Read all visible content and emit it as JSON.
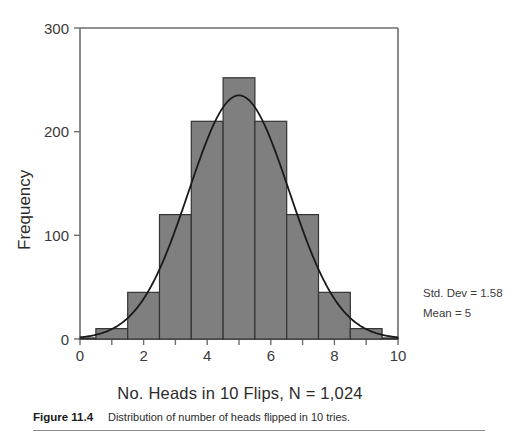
{
  "chart_data": {
    "type": "bar",
    "title": "",
    "xlabel": "No. Heads in 10 Flips, N = 1,024",
    "ylabel": "Frequency",
    "categories": [
      "0",
      "1",
      "2",
      "3",
      "4",
      "5",
      "6",
      "7",
      "8",
      "9",
      "10"
    ],
    "x": [
      0,
      1,
      2,
      3,
      4,
      5,
      6,
      7,
      8,
      9,
      10
    ],
    "values": [
      1,
      10,
      45,
      120,
      210,
      252,
      210,
      120,
      45,
      10,
      1
    ],
    "bar_width": 1,
    "xlim": [
      0,
      10
    ],
    "ylim": [
      0,
      300
    ],
    "x_ticks": [
      0,
      1,
      2,
      3,
      4,
      5,
      6,
      7,
      8,
      9,
      10
    ],
    "x_tick_labels": [
      "0",
      "",
      "2",
      "",
      "4",
      "",
      "6",
      "",
      "8",
      "",
      "10"
    ],
    "y_ticks": [
      0,
      100,
      200,
      300
    ],
    "y_tick_labels": [
      "0",
      "100",
      "200",
      "300"
    ],
    "grid": false,
    "legend": false,
    "bar_color": "#7f7f7f",
    "bar_edge_color": "#333333",
    "overlay": {
      "type": "line",
      "name": "normal curve",
      "color": "#1a1a1a",
      "mean": 5,
      "std_dev": 1.58,
      "peak_value": 235
    },
    "annotations": [
      {
        "name": "std-dev",
        "text": "Std. Dev = 1.58"
      },
      {
        "name": "mean",
        "text": "Mean = 5"
      }
    ]
  },
  "caption": {
    "label": "Figure 11.4",
    "text": "Distribution of number of heads flipped in 10 tries."
  }
}
